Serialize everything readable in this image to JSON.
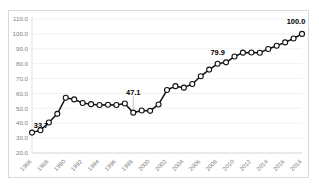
{
  "frame": {
    "border_color": "#d9d9d9",
    "background": "#ffffff"
  },
  "chart_data": {
    "type": "line",
    "title": "",
    "subtitle": "",
    "xlabel": "",
    "ylabel": "",
    "grid": true,
    "grid_axis": "y",
    "legend": false,
    "legend_position": "none",
    "line_color": "#111111",
    "marker_style": "open-circle",
    "marker_fill": "#ffffff",
    "ylim": [
      20.0,
      110.0
    ],
    "ytick_labels": [
      "110.0",
      "100.0",
      "90.0",
      "80.0",
      "70.0",
      "60.0",
      "50.0",
      "40.0",
      "30.0",
      "20.0"
    ],
    "ytick_values": [
      110.0,
      100.0,
      90.0,
      80.0,
      70.0,
      60.0,
      50.0,
      40.0,
      30.0,
      20.0
    ],
    "xtick_labels": [
      "1986",
      "1988",
      "1990",
      "1992",
      "1994",
      "1996",
      "1998",
      "2000",
      "2002",
      "2004",
      "2006",
      "2008",
      "2010",
      "2012",
      "2014",
      "2016",
      "2018"
    ],
    "xtick_rotation": 45,
    "x": [
      1986,
      1987,
      1988,
      1989,
      1990,
      1991,
      1992,
      1993,
      1994,
      1995,
      1996,
      1997,
      1998,
      1999,
      2000,
      2001,
      2002,
      2003,
      2004,
      2005,
      2006,
      2007,
      2008,
      2009,
      2010,
      2011,
      2012,
      2013,
      2014,
      2015,
      2016,
      2017,
      2018
    ],
    "values": [
      33.7,
      35.3,
      40.5,
      46.3,
      57.1,
      56.0,
      53.6,
      52.8,
      52.2,
      52.4,
      52.2,
      53.2,
      47.1,
      48.5,
      48.3,
      52.6,
      62.3,
      64.9,
      63.9,
      66.3,
      71.5,
      76.0,
      79.9,
      80.9,
      84.8,
      87.4,
      87.5,
      87.3,
      89.9,
      92.0,
      94.3,
      96.9,
      100.0
    ],
    "annotations": [
      {
        "label": "33.7",
        "x": 1986,
        "y": 33.7,
        "leader": false
      },
      {
        "label": "47.1",
        "x": 1998,
        "y": 47.1,
        "leader": true
      },
      {
        "label": "79.9",
        "x": 2008,
        "y": 79.9,
        "leader": false
      },
      {
        "label": "100.0",
        "x": 2018,
        "y": 100.0,
        "leader": false
      }
    ]
  }
}
